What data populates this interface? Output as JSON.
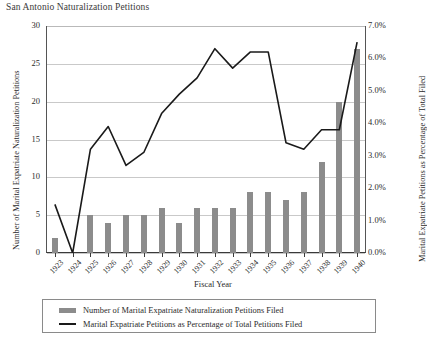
{
  "title": "San Antonio Naturalization Petitions",
  "axes": {
    "x_title": "Fiscal Year",
    "y_left_title": "Number of Marital Expatriate Naturalization Petitions",
    "y_right_title": "Marital Expatriate Petitions as Percentage of Total Filed"
  },
  "legend": {
    "bar_label": "Number of Marital Expatriate Naturalization Petitions Filed",
    "line_label": "Marital Expatriate Petitions as Percentage of Total Petitions Filed"
  },
  "colors": {
    "bar": "#8c8c8c",
    "line": "#1a1a1a",
    "grid": "#c9c9c9",
    "axis": "#3a3a3a",
    "text": "#2b2b2b",
    "background": "#ffffff"
  },
  "chart_data": {
    "type": "bar",
    "title": "San Antonio Naturalization Petitions",
    "xlabel": "Fiscal Year",
    "ylabel": "Number of Marital Expatriate Naturalization Petitions",
    "y2label": "Marital Expatriate Petitions as Percentage of Total Filed",
    "grid": true,
    "legend_position": "bottom",
    "categories": [
      "1923",
      "1924",
      "1925",
      "1926",
      "1927",
      "1928",
      "1929",
      "1930",
      "1931",
      "1932",
      "1933",
      "1934",
      "1935",
      "1936",
      "1937",
      "1938",
      "1939",
      "1940"
    ],
    "ylim": [
      0,
      30
    ],
    "yticks": [
      0,
      5,
      10,
      15,
      20,
      25,
      30
    ],
    "ytick_labels": [
      "0",
      "5",
      "10",
      "15",
      "20",
      "25",
      "30"
    ],
    "y2lim": [
      0,
      7
    ],
    "y2ticks": [
      0,
      1,
      2,
      3,
      4,
      5,
      6,
      7
    ],
    "y2tick_labels": [
      "0.0%",
      "1.0%",
      "2.0%",
      "3.0%",
      "4.0%",
      "5.0%",
      "6.0%",
      "7.0%"
    ],
    "series": [
      {
        "name": "Number of Marital Expatriate Naturalization Petitions Filed",
        "type": "bar",
        "axis": "left",
        "values": [
          2,
          0,
          5,
          4,
          5,
          5,
          6,
          4,
          6,
          6,
          6,
          8,
          8,
          7,
          8,
          12,
          20,
          27
        ]
      },
      {
        "name": "Marital Expatriate Petitions as Percentage of Total Petitions Filed",
        "type": "line",
        "axis": "right",
        "values": [
          1.5,
          0.0,
          3.2,
          3.9,
          2.7,
          3.1,
          4.3,
          4.9,
          5.4,
          6.3,
          5.7,
          6.2,
          6.2,
          3.4,
          3.2,
          3.8,
          3.8,
          6.5
        ]
      }
    ]
  }
}
